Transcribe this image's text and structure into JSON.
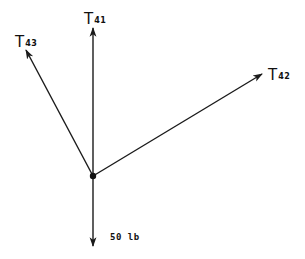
{
  "diagram": {
    "type": "free-body-diagram",
    "center": {
      "x": 93,
      "y": 176
    },
    "stroke_color": "#1a1a1a",
    "forces": [
      {
        "id": "T41",
        "symbol": "T",
        "subscript": "41",
        "tip": {
          "x": 93,
          "y": 28
        },
        "label_pos": {
          "x": 84,
          "y": 10
        }
      },
      {
        "id": "T43",
        "symbol": "T",
        "subscript": "43",
        "tip": {
          "x": 26,
          "y": 50
        },
        "label_pos": {
          "x": 15,
          "y": 33
        }
      },
      {
        "id": "T42",
        "symbol": "T",
        "subscript": "42",
        "tip": {
          "x": 262,
          "y": 74
        },
        "label_pos": {
          "x": 268,
          "y": 66
        }
      },
      {
        "id": "W",
        "label": "50 lb",
        "tip": {
          "x": 93,
          "y": 246
        },
        "label_pos": {
          "x": 110,
          "y": 232
        }
      }
    ]
  },
  "labels": {
    "t41": {
      "main": "T",
      "sub": "41"
    },
    "t43": {
      "main": "T",
      "sub": "43"
    },
    "t42": {
      "main": "T",
      "sub": "42"
    },
    "weight": "50 lb"
  }
}
